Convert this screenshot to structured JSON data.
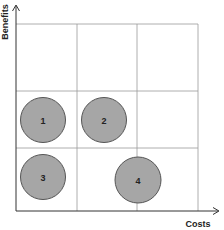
{
  "diagram": {
    "type": "quadrant-matrix",
    "grid": {
      "columns": 3,
      "rows": 3
    },
    "x_axis": {
      "label": "Costs"
    },
    "y_axis": {
      "label": "Benefits"
    },
    "items": [
      {
        "label": "1",
        "column": 1,
        "row": 2
      },
      {
        "label": "2",
        "column": 2,
        "row": 2
      },
      {
        "label": "3",
        "column": 1,
        "row": 1
      },
      {
        "label": "4",
        "column": 2,
        "row": 1,
        "position": "on column boundary 2-3"
      }
    ],
    "colors": {
      "circle_fill": "#a6a6a6",
      "circle_stroke": "#555555",
      "grid": "#999999",
      "axis": "#333333"
    }
  }
}
